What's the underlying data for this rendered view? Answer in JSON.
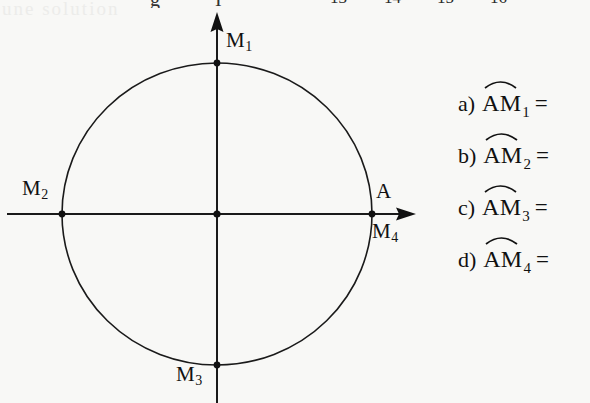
{
  "page": {
    "background_color": "#f8f8f6",
    "ink_color": "#111111",
    "ghost_text": "une solution"
  },
  "top_edge": {
    "cut_off_numbers": [
      "13",
      "14",
      "15",
      "16"
    ],
    "number_x": [
      330,
      384,
      437,
      490
    ],
    "marks": [
      "g",
      "I"
    ],
    "mark_x": [
      150,
      215
    ]
  },
  "figure": {
    "name": "trigonometric-circle",
    "center": {
      "x": 217,
      "y": 214
    },
    "radius_x": 155,
    "radius_y": 151,
    "x_axis": {
      "start_x": 7,
      "end_x": 416,
      "y": 214,
      "arrow": "right"
    },
    "y_axis": {
      "x": 217,
      "start_y": 403,
      "end_y": 12,
      "arrow": "up"
    },
    "points": [
      {
        "name": "M1",
        "label": "M",
        "sub": "1",
        "x": 217,
        "y": 63,
        "label_x": 226,
        "label_y": 30
      },
      {
        "name": "M2",
        "label": "M",
        "sub": "2",
        "x": 62,
        "y": 214,
        "label_x": 22,
        "label_y": 178
      },
      {
        "name": "M3",
        "label": "M",
        "sub": "3",
        "x": 217,
        "y": 365,
        "label_x": 176,
        "label_y": 364
      },
      {
        "name": "M4",
        "label": "M",
        "sub": "4",
        "x": 372,
        "y": 214,
        "label_x": 372,
        "label_y": 221
      },
      {
        "name": "A",
        "label": "A",
        "sub": "",
        "x": 372,
        "y": 214,
        "label_x": 376,
        "label_y": 181
      }
    ]
  },
  "answers": {
    "title": "",
    "items": [
      {
        "letter": "a)",
        "expr": "AM",
        "sub": "1",
        "equals": "=",
        "arc_over": "AM"
      },
      {
        "letter": "b)",
        "expr": "AM",
        "sub": "2",
        "equals": "=",
        "arc_over": "AM"
      },
      {
        "letter": "c)",
        "expr": "AM",
        "sub": "3",
        "equals": "=",
        "arc_over": "AM"
      },
      {
        "letter": "d)",
        "expr": "AM",
        "sub": "4",
        "equals": "=",
        "arc_over": "AM"
      }
    ]
  }
}
